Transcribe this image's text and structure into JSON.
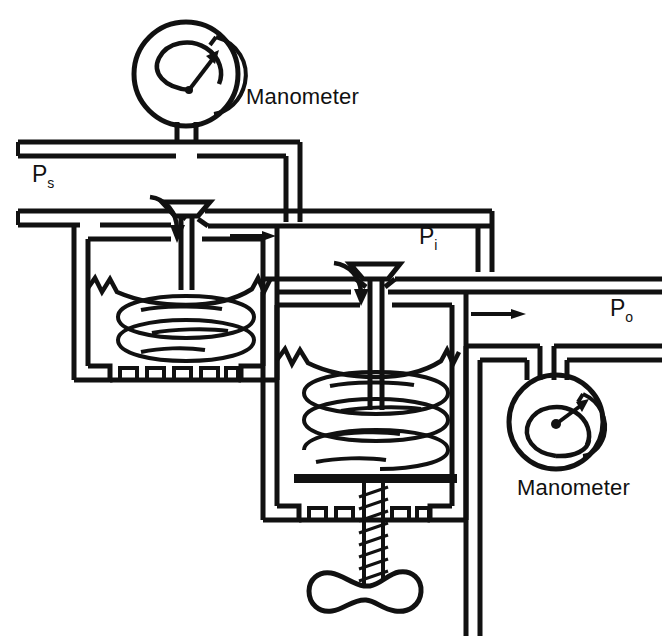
{
  "diagram": {
    "type": "schematic",
    "stroke_color": "#111111",
    "background_color": "#ffffff",
    "labels": {
      "manometer_upper": "Manometer",
      "manometer_lower": "Manometer",
      "supply_pressure": "P",
      "supply_pressure_sub": "s",
      "intermediate_pressure": "P",
      "intermediate_pressure_sub": "i",
      "outlet_pressure": "P",
      "outlet_pressure_sub": "o"
    },
    "components": [
      {
        "name": "upper-manometer-gauge",
        "kind": "bourdon-gauge",
        "cx": 186,
        "cy": 74,
        "r": 52
      },
      {
        "name": "lower-manometer-gauge",
        "kind": "bourdon-gauge",
        "cx": 556,
        "cy": 422,
        "r": 47
      },
      {
        "name": "first-stage-valve",
        "kind": "poppet-valve",
        "x": 182,
        "y": 205
      },
      {
        "name": "second-stage-valve",
        "kind": "poppet-valve",
        "x": 371,
        "y": 265
      },
      {
        "name": "first-stage-diaphragm-chamber",
        "kind": "chamber",
        "x": 88,
        "y": 215,
        "w": 175,
        "h": 165
      },
      {
        "name": "second-stage-diaphragm-chamber",
        "kind": "chamber",
        "x": 277,
        "y": 285,
        "w": 190,
        "h": 235
      },
      {
        "name": "first-stage-spring",
        "kind": "coil-spring"
      },
      {
        "name": "second-stage-spring",
        "kind": "coil-spring"
      },
      {
        "name": "adjusting-screw",
        "kind": "threaded-stem"
      },
      {
        "name": "adjusting-handwheel",
        "kind": "wing-handle"
      },
      {
        "name": "supply-flow-arrow",
        "kind": "flow-arrow"
      },
      {
        "name": "outlet-flow-arrow",
        "kind": "flow-arrow"
      }
    ]
  }
}
